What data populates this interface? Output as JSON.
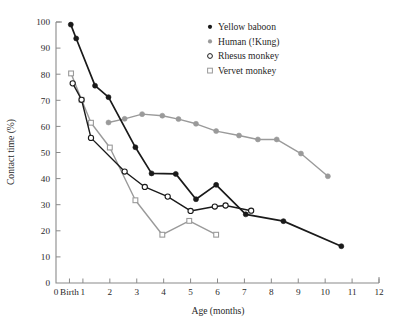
{
  "figure": {
    "background": "#ffffff",
    "caption_fragment": ""
  },
  "axes": {
    "x": {
      "label": "Age (months)",
      "tick_labels": [
        "0",
        "Birth",
        "1",
        "2",
        "3",
        "4",
        "5",
        "6",
        "7",
        "8",
        "9",
        "10",
        "11",
        "12"
      ],
      "tick_values": [
        0,
        0.5,
        1,
        2,
        3,
        4,
        5,
        6,
        7,
        8,
        9,
        10,
        11,
        12
      ],
      "min": 0,
      "max": 12
    },
    "y": {
      "label": "Contact time (%)",
      "tick_labels": [
        "0",
        "10",
        "20",
        "30",
        "40",
        "50",
        "60",
        "70",
        "80",
        "90",
        "100"
      ],
      "tick_values": [
        0,
        10,
        20,
        30,
        40,
        50,
        60,
        70,
        80,
        90,
        100
      ],
      "min": 0,
      "max": 100
    },
    "grid": "off"
  },
  "legend": {
    "position": "top-right",
    "items": [
      {
        "label": "Yellow baboon",
        "marker": "filled-circle",
        "color": "#1a1a1a"
      },
      {
        "label": "Human (!Kung)",
        "marker": "filled-circle",
        "color": "#9a9a9a"
      },
      {
        "label": "Rhesus monkey",
        "marker": "open-circle",
        "color": "#1a1a1a"
      },
      {
        "label": "Vervet monkey",
        "marker": "open-square",
        "color": "#9a9a9a"
      }
    ]
  },
  "chart_data": {
    "type": "line",
    "title": "",
    "subtitle": "",
    "xlabel": "Age (months)",
    "ylabel": "Contact time (%)",
    "xlim": [
      0,
      12
    ],
    "ylim": [
      0,
      100
    ],
    "xtick_labels": [
      "0",
      "Birth",
      "1",
      "2",
      "3",
      "4",
      "5",
      "6",
      "7",
      "8",
      "9",
      "10",
      "11",
      "12"
    ],
    "ytick_labels": [
      "0",
      "10",
      "20",
      "30",
      "40",
      "50",
      "60",
      "70",
      "80",
      "90",
      "100"
    ],
    "grid": false,
    "legend_position": "top-right",
    "annotations": [],
    "series": [
      {
        "name": "Yellow baboon",
        "marker": "filled-circle",
        "color": "#1a1a1a",
        "linewidth": 1.7,
        "x": [
          0.55,
          0.75,
          1.45,
          1.95,
          2.95,
          3.55,
          4.45,
          5.2,
          5.95,
          7.05,
          8.45,
          10.6
        ],
        "y": [
          99.0,
          93.7,
          75.6,
          71.2,
          52.0,
          42.0,
          41.8,
          32.1,
          37.6,
          26.3,
          23.7,
          14.1
        ]
      },
      {
        "name": "Human (!Kung)",
        "marker": "filled-circle",
        "color": "#9a9a9a",
        "linewidth": 1.4,
        "x": [
          1.95,
          2.55,
          3.2,
          3.95,
          4.55,
          5.2,
          5.95,
          6.8,
          7.5,
          8.2,
          9.1,
          10.1
        ],
        "y": [
          61.5,
          62.9,
          64.7,
          64.1,
          62.8,
          61.0,
          58.2,
          56.5,
          55.0,
          55.0,
          49.6,
          40.9
        ]
      },
      {
        "name": "Rhesus monkey",
        "marker": "open-circle",
        "color": "#1a1a1a",
        "linewidth": 1.4,
        "x": [
          0.62,
          0.95,
          1.3,
          2.55,
          3.3,
          4.15,
          5.0,
          5.9,
          6.3,
          7.25
        ],
        "y": [
          76.5,
          70.2,
          55.6,
          42.7,
          36.8,
          33.1,
          27.6,
          29.3,
          29.7,
          27.7
        ]
      },
      {
        "name": "Vervet monkey",
        "marker": "open-square",
        "color": "#9a9a9a",
        "linewidth": 1.4,
        "x": [
          0.56,
          0.95,
          1.3,
          2.0,
          2.95,
          3.95,
          4.95,
          5.95
        ],
        "y": [
          80.3,
          70.2,
          61.4,
          51.9,
          31.7,
          18.5,
          23.8,
          18.5
        ]
      }
    ]
  }
}
